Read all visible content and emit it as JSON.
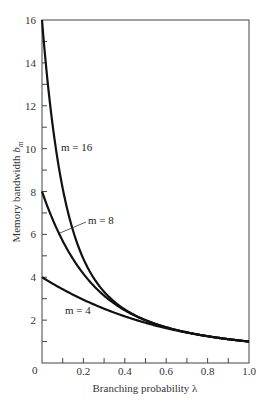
{
  "chart_data": {
    "type": "line",
    "title": "",
    "xlabel": "Branching probability λ",
    "ylabel": "Memory bandwidth b_m",
    "ylabel_main": "Memory bandwidth ",
    "ylabel_var": "b",
    "ylabel_sub": "m",
    "xlim": [
      0,
      1.0
    ],
    "ylim": [
      0,
      16
    ],
    "grid": false,
    "legend_position": "inline labels",
    "x_ticks": [
      0.2,
      0.4,
      0.6,
      0.8,
      1.0
    ],
    "x_tick_labels": [
      "0.2",
      "0.4",
      "0.6",
      "0.8",
      "1.0"
    ],
    "x_minor_ticks": [
      0.1,
      0.3,
      0.5,
      0.7,
      0.9
    ],
    "y_ticks": [
      0,
      2,
      4,
      6,
      8,
      10,
      12,
      14,
      16
    ],
    "y_tick_labels": [
      "0",
      "2",
      "4",
      "6",
      "8",
      "10",
      "12",
      "14",
      "16"
    ],
    "y_minor_ticks": [
      1,
      3,
      5,
      7,
      9,
      11,
      13,
      15
    ],
    "x": [
      0.0,
      0.02,
      0.05,
      0.1,
      0.15,
      0.2,
      0.25,
      0.3,
      0.4,
      0.5,
      0.6,
      0.7,
      0.8,
      0.9,
      1.0
    ],
    "series": [
      {
        "name": "m = 16",
        "m": 16,
        "values": [
          16.0,
          13.88,
          11.12,
          8.15,
          6.17,
          4.86,
          3.96,
          3.33,
          2.5,
          2.0,
          1.67,
          1.43,
          1.25,
          1.11,
          1.0
        ]
      },
      {
        "name": "m = 8",
        "m": 8,
        "values": [
          8.0,
          7.47,
          6.7,
          5.7,
          4.85,
          4.16,
          3.6,
          3.14,
          2.45,
          1.99,
          1.67,
          1.43,
          1.25,
          1.11,
          1.0
        ]
      },
      {
        "name": "m = 4",
        "m": 4,
        "values": [
          4.0,
          3.88,
          3.71,
          3.44,
          3.2,
          2.95,
          2.73,
          2.53,
          2.18,
          1.88,
          1.62,
          1.42,
          1.25,
          1.11,
          1.0
        ]
      }
    ],
    "annotations": [
      {
        "text": "m = 16",
        "near": "m=16 curve at λ≈0.12, b≈10"
      },
      {
        "text": "m = 8",
        "near": "m=8 curve at λ≈0.09, b≈6, with leader line"
      },
      {
        "text": "m = 4",
        "near": "below m=4 curve at λ≈0.2, b≈2.5"
      }
    ],
    "formula_hint": "b_m = (1 - (1 - λ)^m) / λ"
  },
  "labels": {
    "m16": "m = 16",
    "m8": "m = 8",
    "m4": "m = 4",
    "origin": "0"
  }
}
